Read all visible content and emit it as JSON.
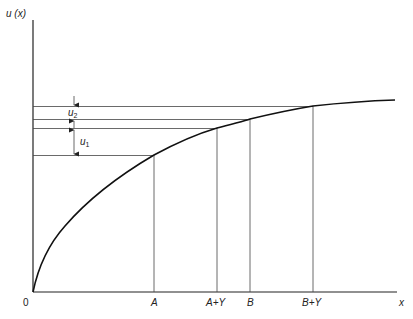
{
  "diagram": {
    "y_axis_label": "u (x)",
    "x_axis_label": "x",
    "origin_label": "0",
    "x_points": [
      {
        "label": "A",
        "x": 154,
        "u_y": 155
      },
      {
        "label": "A+Y",
        "x": 217,
        "u_y": 128
      },
      {
        "label": "B",
        "x": 250,
        "u_y": 119
      },
      {
        "label": "B+Y",
        "x": 313,
        "u_y": 106
      }
    ],
    "increments": [
      {
        "label": "u",
        "subscript": "2",
        "from_y": 106,
        "to_y": 119
      },
      {
        "label": "u",
        "subscript": "1",
        "from_y": 128,
        "to_y": 155
      }
    ],
    "colors": {
      "line": "#222222",
      "background": "#ffffff"
    }
  }
}
